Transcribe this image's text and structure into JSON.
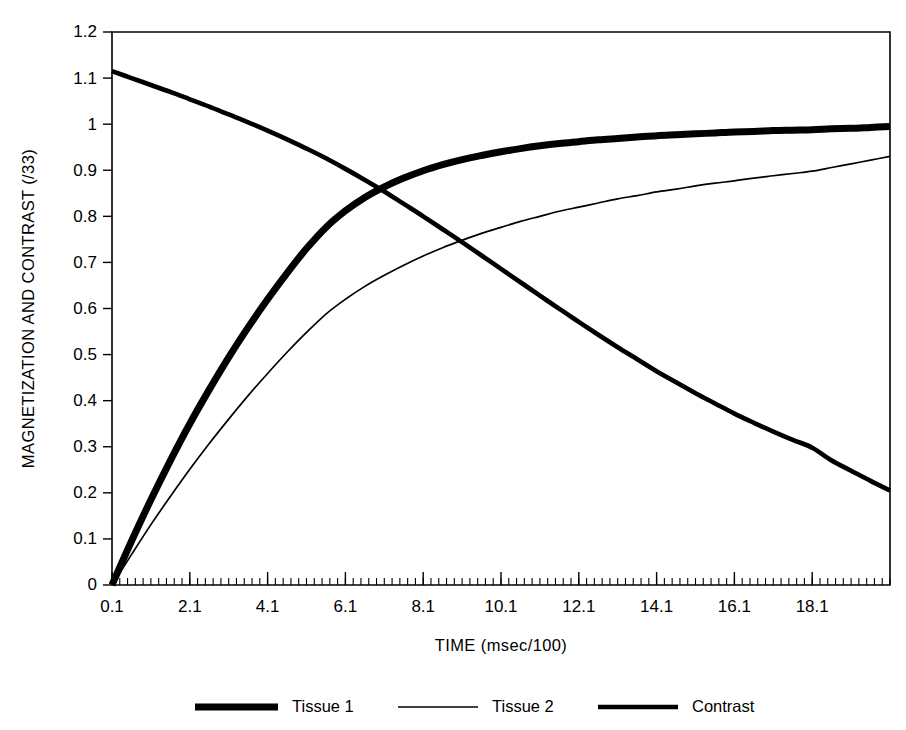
{
  "chart_data": {
    "type": "line",
    "title": "",
    "xlabel": "TIME (msec/100)",
    "ylabel": "MAGNETIZATION AND CONTRAST (/33)",
    "xlim": [
      0.1,
      20.1
    ],
    "ylim": [
      0,
      1.2
    ],
    "grid": false,
    "legend_position": "bottom",
    "x_tick_labels": [
      "0.1",
      "2.1",
      "4.1",
      "6.1",
      "8.1",
      "10.1",
      "12.1",
      "14.1",
      "16.1",
      "18.1"
    ],
    "x_tick_values": [
      0.1,
      2.1,
      4.1,
      6.1,
      8.1,
      10.1,
      12.1,
      14.1,
      16.1,
      18.1
    ],
    "x_minor_step": 0.2,
    "y_tick_labels": [
      "0",
      "0.1",
      "0.2",
      "0.3",
      "0.4",
      "0.5",
      "0.6",
      "0.7",
      "0.8",
      "0.9",
      "1",
      "1.1",
      "1.2"
    ],
    "y_tick_values": [
      0,
      0.1,
      0.2,
      0.3,
      0.4,
      0.5,
      0.6,
      0.7,
      0.8,
      0.9,
      1,
      1.1,
      1.2
    ],
    "x": [
      0.1,
      0.6,
      1.1,
      1.6,
      2.1,
      2.6,
      3.1,
      3.6,
      4.1,
      4.6,
      5.1,
      5.6,
      6.1,
      6.6,
      7.1,
      7.6,
      8.1,
      8.6,
      9.1,
      9.6,
      10.1,
      10.6,
      11.1,
      11.6,
      12.1,
      12.6,
      13.1,
      13.6,
      14.1,
      14.6,
      15.1,
      15.6,
      16.1,
      16.6,
      17.1,
      17.6,
      18.1,
      18.6,
      19.1,
      19.6,
      20.1
    ],
    "series": [
      {
        "name": "Tissue 1",
        "line_width": 7,
        "color": "#000000",
        "values": [
          0.0,
          0.095,
          0.185,
          0.27,
          0.35,
          0.424,
          0.494,
          0.559,
          0.62,
          0.677,
          0.73,
          0.776,
          0.812,
          0.841,
          0.864,
          0.883,
          0.899,
          0.912,
          0.923,
          0.932,
          0.94,
          0.947,
          0.953,
          0.958,
          0.962,
          0.966,
          0.969,
          0.972,
          0.975,
          0.977,
          0.979,
          0.981,
          0.983,
          0.984,
          0.986,
          0.987,
          0.988,
          0.99,
          0.991,
          0.993,
          0.995
        ]
      },
      {
        "name": "Tissue 2",
        "line_width": 1.7,
        "color": "#000000",
        "values": [
          0.0,
          0.066,
          0.131,
          0.192,
          0.251,
          0.307,
          0.36,
          0.411,
          0.459,
          0.505,
          0.548,
          0.588,
          0.62,
          0.648,
          0.672,
          0.694,
          0.714,
          0.732,
          0.748,
          0.763,
          0.776,
          0.789,
          0.8,
          0.811,
          0.82,
          0.829,
          0.838,
          0.845,
          0.853,
          0.859,
          0.866,
          0.872,
          0.877,
          0.883,
          0.888,
          0.893,
          0.898,
          0.906,
          0.914,
          0.922,
          0.93
        ]
      },
      {
        "name": "Contrast",
        "line_width": 4.6,
        "color": "#000000",
        "values": [
          1.115,
          1.1,
          1.085,
          1.07,
          1.054,
          1.038,
          1.021,
          1.004,
          0.986,
          0.967,
          0.947,
          0.926,
          0.903,
          0.879,
          0.854,
          0.827,
          0.8,
          0.772,
          0.744,
          0.715,
          0.686,
          0.657,
          0.628,
          0.599,
          0.571,
          0.543,
          0.516,
          0.49,
          0.464,
          0.44,
          0.416,
          0.394,
          0.372,
          0.352,
          0.333,
          0.315,
          0.298,
          0.27,
          0.248,
          0.226,
          0.205
        ]
      }
    ]
  },
  "legend": {
    "items": [
      {
        "label": "Tissue 1"
      },
      {
        "label": "Tissue 2"
      },
      {
        "label": "Contrast"
      }
    ]
  }
}
